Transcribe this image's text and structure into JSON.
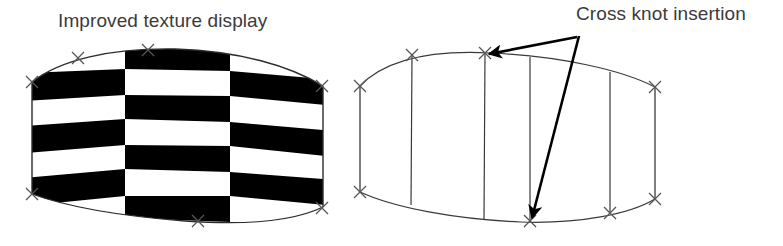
{
  "figure": {
    "width": 783,
    "height": 246,
    "background_color": "#ffffff"
  },
  "labels": {
    "left_caption": "Improved texture display",
    "right_caption": "Cross knot insertion",
    "text_color": "#3b3b3b"
  },
  "left_panel": {
    "name": "textured-surface-patch",
    "description": "Curved quadrilateral surface patch filled with a black-and-white checkerboard texture",
    "texture": {
      "type": "checkerboard",
      "columns": 3,
      "rows": 6,
      "dark_color": "#000000",
      "light_color": "#ffffff",
      "column_boundaries_x": [
        32,
        125,
        230,
        325
      ],
      "row_boundaries_y": [
        52,
        78,
        103,
        128,
        152,
        178,
        205
      ]
    },
    "outline_color": "#2b2b2b",
    "control_points": [
      {
        "x": 32,
        "y": 82
      },
      {
        "x": 78,
        "y": 58
      },
      {
        "x": 148,
        "y": 50
      },
      {
        "x": 322,
        "y": 86
      },
      {
        "x": 32,
        "y": 195
      },
      {
        "x": 198,
        "y": 221
      },
      {
        "x": 322,
        "y": 208
      }
    ],
    "marker_glyph": "x-marker"
  },
  "right_panel": {
    "name": "wireframe-knot-insertion-patch",
    "description": "Curved quadrilateral control mesh drawn as wireframe with vertical isoparametric curves showing inserted cross knots",
    "outline_color": "#2b2b2b",
    "isocurves_x": [
      412,
      485,
      530,
      610
    ],
    "control_points": [
      {
        "x": 360,
        "y": 86
      },
      {
        "x": 412,
        "y": 55
      },
      {
        "x": 485,
        "y": 53
      },
      {
        "x": 655,
        "y": 87
      },
      {
        "x": 360,
        "y": 192
      },
      {
        "x": 530,
        "y": 222
      },
      {
        "x": 610,
        "y": 213
      },
      {
        "x": 655,
        "y": 199
      }
    ],
    "marker_glyph": "x-marker",
    "annotation_arrows": [
      {
        "name": "arrow-to-top-knot",
        "from": {
          "x": 575,
          "y": 37
        },
        "to": {
          "x": 487,
          "y": 54
        },
        "color": "#000000"
      },
      {
        "name": "arrow-to-bottom-knot",
        "from": {
          "x": 578,
          "y": 36
        },
        "to": {
          "x": 532,
          "y": 221
        },
        "color": "#000000"
      }
    ]
  }
}
